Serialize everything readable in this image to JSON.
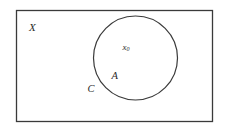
{
  "diagram": {
    "type": "set-diagram",
    "universe": {
      "label": "X",
      "shape": "rectangle",
      "x": 16,
      "y": 10,
      "width": 197,
      "height": 112,
      "stroke": "#3a3a3a"
    },
    "set": {
      "label": "A",
      "shape": "circle",
      "cx": 135.5,
      "cy": 58,
      "r": 42,
      "stroke": "#3a3a3a"
    },
    "boundary": {
      "label": "C"
    },
    "point": {
      "label_base": "x",
      "label_sub": "0"
    }
  }
}
